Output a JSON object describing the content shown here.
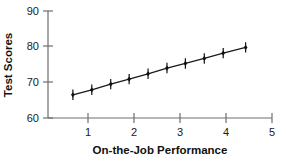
{
  "chart_data": {
    "type": "scatter",
    "title": "",
    "xlabel": "On-the-Job Performance",
    "ylabel": "Test Scores",
    "xlim": [
      0.5,
      5
    ],
    "ylim": [
      60,
      90
    ],
    "xticks": [
      "1",
      "2",
      "3",
      "4",
      "5"
    ],
    "xtick_values": [
      1,
      2,
      3,
      4,
      5
    ],
    "yticks": [
      "60",
      "70",
      "80",
      "90"
    ],
    "ytick_values": [
      60,
      70,
      80,
      90
    ],
    "grid": false,
    "legend": null,
    "legend_position": "none",
    "marker": "diamond-cross",
    "line": "solid",
    "series": [
      {
        "name": "Test Scores vs On-the-Job Performance",
        "x": [
          1.0,
          1.38,
          1.76,
          2.13,
          2.51,
          2.89,
          3.26,
          3.64,
          4.02,
          4.47
        ],
        "y": [
          66.5,
          67.9,
          69.5,
          70.9,
          72.4,
          74.0,
          75.3,
          76.7,
          78.2,
          79.8
        ]
      }
    ],
    "colors": {
      "line": "#1a1a1a",
      "marker": "#111111",
      "axis": "#6e6e6e",
      "text": "#1a1a1a",
      "background": "#ffffff"
    }
  },
  "axis_titles": {
    "x": "On-the-Job Performance",
    "y": "Test Scores"
  },
  "tick_labels": {
    "y0": "60",
    "y1": "70",
    "y2": "80",
    "y3": "90",
    "x1": "1",
    "x2": "2",
    "x3": "3",
    "x4": "4",
    "x5": "5"
  }
}
